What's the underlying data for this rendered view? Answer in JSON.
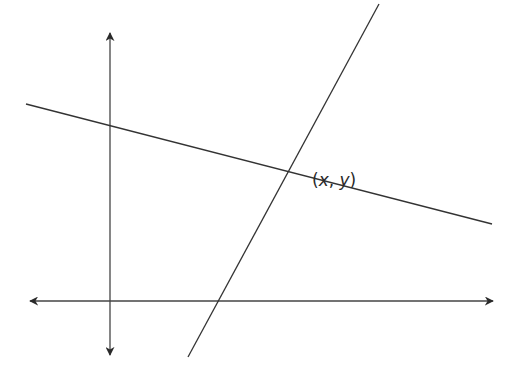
{
  "diagram": {
    "axes": {
      "x_axis": {
        "x1": 30,
        "y": 301,
        "x2": 493,
        "arrows": "both"
      },
      "y_axis": {
        "x": 110,
        "y1": 33,
        "y2": 355,
        "arrows": "both"
      }
    },
    "lines": [
      {
        "name": "shallow-line",
        "x1": 26,
        "y1": 104,
        "x2": 492,
        "y2": 224
      },
      {
        "name": "steep-line",
        "x1": 379,
        "y1": 4,
        "x2": 188,
        "y2": 357
      }
    ],
    "intersection": {
      "label": "(x, y)",
      "label_parts": {
        "open": "(",
        "x": "x",
        "sep": ", ",
        "y": "y",
        "close": ")"
      },
      "approx_px": [
        292,
        174
      ]
    },
    "colors": {
      "line": "#333333",
      "background": "#ffffff"
    }
  }
}
